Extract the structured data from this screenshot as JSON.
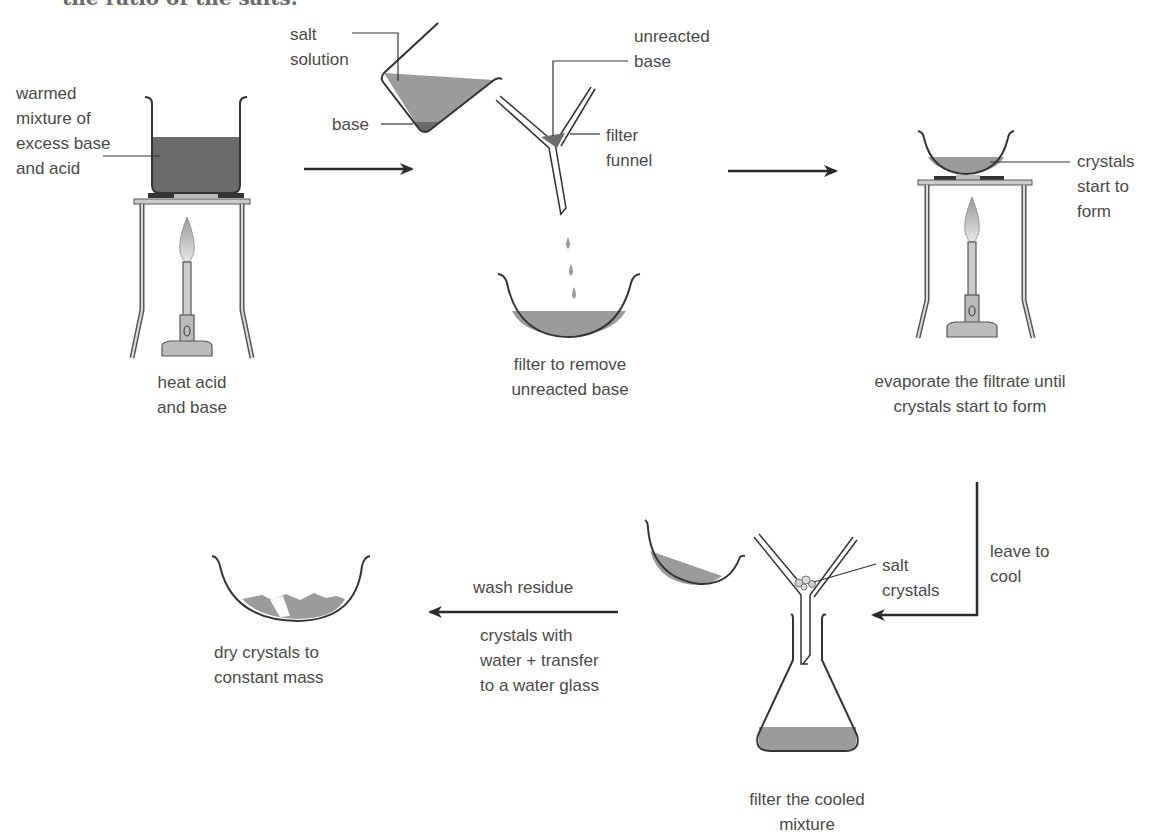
{
  "header": {
    "clipped_title": "the ratio of the salts."
  },
  "colors": {
    "liquid_dark": "#6b6b6b",
    "liquid_light": "#9b9b9b",
    "outline": "#333333",
    "label_text": "#4a4a4a",
    "arrow": "#2a2a2a"
  },
  "steps": [
    {
      "id": "heat",
      "caption": "heat acid\nand base",
      "labels": {
        "mixture": "warmed\nmixture of\nexcess base\nand acid"
      }
    },
    {
      "id": "filter",
      "caption": "filter to remove\nunreacted base",
      "labels": {
        "salt_solution": "salt\nsolution",
        "base": "base",
        "unreacted_base": "unreacted\nbase",
        "filter_funnel": "filter\nfunnel"
      }
    },
    {
      "id": "evaporate",
      "caption": "evaporate the filtrate until\ncrystals start to form",
      "labels": {
        "crystals": "crystals\nstart to\nform"
      }
    },
    {
      "id": "cool",
      "caption": "leave to\ncool"
    },
    {
      "id": "filter-cooled",
      "caption": "filter the cooled\nmixture",
      "labels": {
        "salt_crystals": "salt\ncrystals"
      }
    },
    {
      "id": "wash",
      "caption_above": "wash residue",
      "caption_below": "crystals with\nwater + transfer\nto a water glass"
    },
    {
      "id": "dry",
      "caption": "dry crystals to\nconstant mass"
    }
  ]
}
